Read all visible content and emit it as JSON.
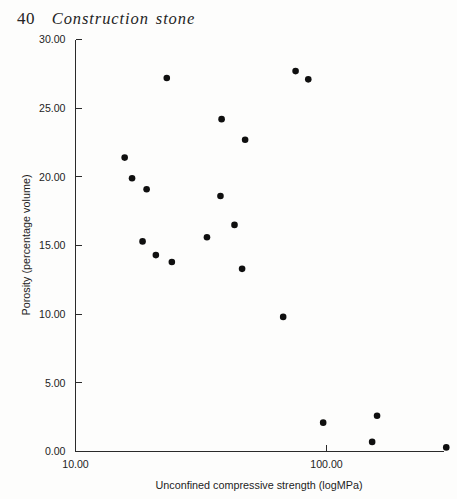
{
  "page": {
    "folio": "40",
    "running_title": "Construction stone",
    "background_color": "#fdfdfc",
    "ink_color": "#1b1b1b"
  },
  "chart_data": {
    "type": "scatter",
    "title": "",
    "xlabel": "Unconfined compressive strength (logMPa)",
    "ylabel": "Porosity (percentage volume)",
    "x_scale": "log",
    "y_scale": "linear",
    "xlim": [
      10.0,
      310.0
    ],
    "ylim": [
      0.0,
      30.0
    ],
    "grid": false,
    "legend": "none",
    "marker": {
      "shape": "circle",
      "color": "#0f0f0f",
      "size_px": 6.6
    },
    "xticks": [
      10.0,
      100.0
    ],
    "xtick_labels": [
      "10.00",
      "100.00"
    ],
    "yticks": [
      0.0,
      5.0,
      10.0,
      15.0,
      20.0,
      25.0,
      30.0
    ],
    "ytick_labels": [
      "0.00",
      "5.00",
      "10.00",
      "15.00",
      "20.00",
      "25.00",
      "30.00"
    ],
    "x": [
      23.1,
      75.3,
      84.6,
      38.2,
      47.4,
      15.7,
      16.8,
      19.2,
      37.8,
      43.0,
      33.4,
      18.5,
      20.9,
      24.2,
      46.1,
      67.2,
      97.0,
      159.0,
      152.0,
      300.0
    ],
    "y": [
      27.2,
      27.7,
      27.1,
      24.2,
      22.7,
      21.4,
      19.9,
      19.1,
      18.6,
      16.5,
      15.6,
      15.3,
      14.3,
      13.8,
      13.3,
      9.8,
      2.1,
      2.6,
      0.7,
      0.3
    ],
    "points": [
      {
        "x": 23.1,
        "y": 27.2
      },
      {
        "x": 75.3,
        "y": 27.7
      },
      {
        "x": 84.6,
        "y": 27.1
      },
      {
        "x": 38.2,
        "y": 24.2
      },
      {
        "x": 47.4,
        "y": 22.7
      },
      {
        "x": 15.7,
        "y": 21.4
      },
      {
        "x": 16.8,
        "y": 19.9
      },
      {
        "x": 19.2,
        "y": 19.1
      },
      {
        "x": 37.8,
        "y": 18.6
      },
      {
        "x": 43.0,
        "y": 16.5
      },
      {
        "x": 33.4,
        "y": 15.6
      },
      {
        "x": 18.5,
        "y": 15.3
      },
      {
        "x": 20.9,
        "y": 14.3
      },
      {
        "x": 24.2,
        "y": 13.8
      },
      {
        "x": 46.1,
        "y": 13.3
      },
      {
        "x": 67.2,
        "y": 9.8
      },
      {
        "x": 97.0,
        "y": 2.1
      },
      {
        "x": 159.0,
        "y": 2.6
      },
      {
        "x": 152.0,
        "y": 0.7
      },
      {
        "x": 300.0,
        "y": 0.3
      }
    ],
    "n_points": 20
  }
}
